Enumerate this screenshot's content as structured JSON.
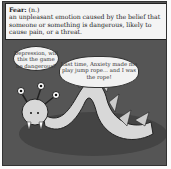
{
  "definition": {
    "term": "Fear:",
    "pos": "(n.)",
    "text": "an unpleasant emotion caused by the belief that someone or something is dangerous, likely to cause pain, or a threat."
  },
  "bubbles": [
    {
      "speaker": "Depression",
      "text": "Depression, will this the game be dangerous?"
    },
    {
      "speaker": "Anxiety-monster",
      "text": "Last time, Anxiety made me play jump rope... and I was the rope!"
    }
  ],
  "colors": {
    "panel_bg": "#555555",
    "monster": "#d8d8d8",
    "shadow": "#444444"
  }
}
